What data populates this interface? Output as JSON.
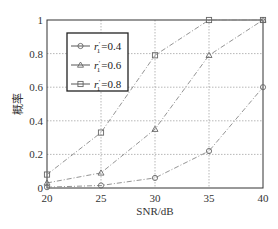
{
  "chart_data": {
    "type": "line",
    "title": "",
    "xlabel": "SNR/dB",
    "ylabel": "概率",
    "x": [
      20,
      25,
      30,
      35,
      40
    ],
    "xticks": [
      "20",
      "25",
      "30",
      "35",
      "40"
    ],
    "yticks": [
      "0",
      "0.2",
      "0.4",
      "0.6",
      "0.8",
      "1"
    ],
    "xlim": [
      20,
      40
    ],
    "ylim": [
      0,
      1
    ],
    "grid": true,
    "legend_position": "upper-left",
    "series": [
      {
        "name": "r1'=0.4",
        "label_var": "r",
        "label_sub": "1",
        "label_sup": "′",
        "label_value": "=0.4",
        "marker": "circle",
        "linestyle": "dashdot",
        "values": [
          0.005,
          0.015,
          0.06,
          0.22,
          0.6
        ]
      },
      {
        "name": "r1'=0.6",
        "label_var": "r",
        "label_sub": "1",
        "label_sup": "′",
        "label_value": "=0.6",
        "marker": "triangle",
        "linestyle": "dashdot",
        "values": [
          0.03,
          0.09,
          0.35,
          0.79,
          1.0
        ]
      },
      {
        "name": "r1'=0.8",
        "label_var": "r",
        "label_sub": "1",
        "label_sup": "′",
        "label_value": "=0.8",
        "marker": "square",
        "linestyle": "dashdot",
        "values": [
          0.08,
          0.33,
          0.79,
          1.0,
          1.0
        ]
      }
    ]
  },
  "colors": {
    "line": "#888888",
    "axis": "#333333",
    "grid": "#999999"
  }
}
